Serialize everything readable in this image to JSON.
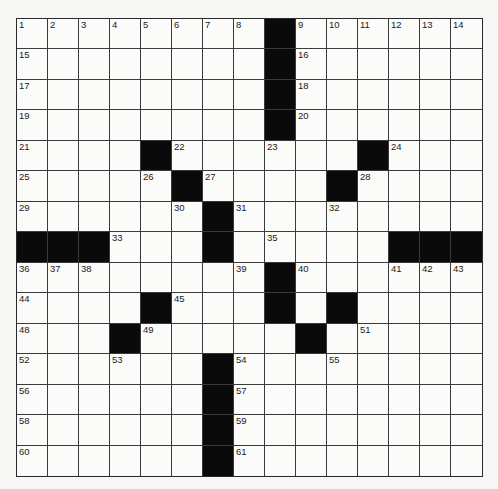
{
  "puzzle": {
    "rows": 15,
    "cols": 15,
    "grid": [
      "........#......",
      "........#......",
      "........#......",
      "........#......",
      "....#......#...",
      ".....#....#....",
      "......#........",
      "###...#.....###",
      "........#......",
      "....#...#.#....",
      "...#.....#.....",
      "......#........",
      "......#........",
      "......#........",
      "......#........"
    ],
    "numbers": [
      {
        "r": 0,
        "c": 0,
        "n": "1"
      },
      {
        "r": 0,
        "c": 1,
        "n": "2"
      },
      {
        "r": 0,
        "c": 2,
        "n": "3"
      },
      {
        "r": 0,
        "c": 3,
        "n": "4"
      },
      {
        "r": 0,
        "c": 4,
        "n": "5"
      },
      {
        "r": 0,
        "c": 5,
        "n": "6"
      },
      {
        "r": 0,
        "c": 6,
        "n": "7"
      },
      {
        "r": 0,
        "c": 7,
        "n": "8"
      },
      {
        "r": 0,
        "c": 9,
        "n": "9"
      },
      {
        "r": 0,
        "c": 10,
        "n": "10"
      },
      {
        "r": 0,
        "c": 11,
        "n": "11"
      },
      {
        "r": 0,
        "c": 12,
        "n": "12"
      },
      {
        "r": 0,
        "c": 13,
        "n": "13"
      },
      {
        "r": 0,
        "c": 14,
        "n": "14"
      },
      {
        "r": 1,
        "c": 0,
        "n": "15"
      },
      {
        "r": 1,
        "c": 9,
        "n": "16"
      },
      {
        "r": 2,
        "c": 0,
        "n": "17"
      },
      {
        "r": 2,
        "c": 9,
        "n": "18"
      },
      {
        "r": 3,
        "c": 0,
        "n": "19"
      },
      {
        "r": 3,
        "c": 9,
        "n": "20"
      },
      {
        "r": 4,
        "c": 0,
        "n": "21"
      },
      {
        "r": 4,
        "c": 5,
        "n": "22"
      },
      {
        "r": 4,
        "c": 8,
        "n": "23"
      },
      {
        "r": 4,
        "c": 12,
        "n": "24"
      },
      {
        "r": 5,
        "c": 0,
        "n": "25"
      },
      {
        "r": 5,
        "c": 4,
        "n": "26"
      },
      {
        "r": 5,
        "c": 6,
        "n": "27"
      },
      {
        "r": 5,
        "c": 11,
        "n": "28"
      },
      {
        "r": 6,
        "c": 0,
        "n": "29"
      },
      {
        "r": 6,
        "c": 5,
        "n": "30"
      },
      {
        "r": 6,
        "c": 7,
        "n": "31"
      },
      {
        "r": 6,
        "c": 10,
        "n": "32"
      },
      {
        "r": 7,
        "c": 3,
        "n": "33"
      },
      {
        "r": 7,
        "c": 6,
        "n": "34"
      },
      {
        "r": 7,
        "c": 8,
        "n": "35"
      },
      {
        "r": 8,
        "c": 0,
        "n": "36"
      },
      {
        "r": 8,
        "c": 1,
        "n": "37"
      },
      {
        "r": 8,
        "c": 2,
        "n": "38"
      },
      {
        "r": 8,
        "c": 7,
        "n": "39"
      },
      {
        "r": 8,
        "c": 9,
        "n": "40"
      },
      {
        "r": 8,
        "c": 12,
        "n": "41"
      },
      {
        "r": 8,
        "c": 13,
        "n": "42"
      },
      {
        "r": 8,
        "c": 14,
        "n": "43"
      },
      {
        "r": 9,
        "c": 0,
        "n": "44"
      },
      {
        "r": 9,
        "c": 5,
        "n": "45"
      },
      {
        "r": 9,
        "c": 8,
        "n": "46"
      },
      {
        "r": 9,
        "c": 10,
        "n": "47"
      },
      {
        "r": 10,
        "c": 0,
        "n": "48"
      },
      {
        "r": 10,
        "c": 4,
        "n": "49"
      },
      {
        "r": 10,
        "c": 9,
        "n": "50"
      },
      {
        "r": 10,
        "c": 11,
        "n": "51"
      },
      {
        "r": 11,
        "c": 0,
        "n": "52"
      },
      {
        "r": 11,
        "c": 3,
        "n": "53"
      },
      {
        "r": 11,
        "c": 7,
        "n": "54"
      },
      {
        "r": 11,
        "c": 10,
        "n": "55"
      },
      {
        "r": 12,
        "c": 0,
        "n": "56"
      },
      {
        "r": 12,
        "c": 7,
        "n": "57"
      },
      {
        "r": 13,
        "c": 0,
        "n": "58"
      },
      {
        "r": 13,
        "c": 7,
        "n": "59"
      },
      {
        "r": 14,
        "c": 0,
        "n": "60"
      },
      {
        "r": 14,
        "c": 7,
        "n": "61"
      }
    ],
    "colors": {
      "block": "#0a0a0a",
      "cell": "#fbfbfa",
      "line": "#3a3a3a",
      "page": "#f6f6f4"
    }
  }
}
